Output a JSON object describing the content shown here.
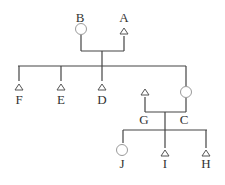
{
  "diagram": {
    "type": "pedigree",
    "legend_note": "circle = female, triangle = male",
    "colors": {
      "line": "#444444",
      "female_outline": "#9a9a9a",
      "male_outline": "#555555",
      "text": "#333333"
    },
    "individuals": [
      {
        "id": "B",
        "label": "B",
        "symbol": "circle",
        "generation": 1
      },
      {
        "id": "A",
        "label": "A",
        "symbol": "triangle",
        "generation": 1
      },
      {
        "id": "F",
        "label": "F",
        "symbol": "triangle",
        "generation": 2
      },
      {
        "id": "E",
        "label": "E",
        "symbol": "triangle",
        "generation": 2
      },
      {
        "id": "D",
        "label": "D",
        "symbol": "triangle",
        "generation": 2
      },
      {
        "id": "C",
        "label": "C",
        "symbol": "circle",
        "generation": 2
      },
      {
        "id": "G",
        "label": "G",
        "symbol": "triangle",
        "generation": 2
      },
      {
        "id": "J",
        "label": "J",
        "symbol": "circle",
        "generation": 3
      },
      {
        "id": "I",
        "label": "I",
        "symbol": "triangle",
        "generation": 3
      },
      {
        "id": "H",
        "label": "H",
        "symbol": "triangle",
        "generation": 3
      }
    ],
    "unions": [
      {
        "partners": [
          "B",
          "A"
        ],
        "children": [
          "F",
          "E",
          "D",
          "C"
        ]
      },
      {
        "partners": [
          "G",
          "C"
        ],
        "children": [
          "J",
          "I",
          "H"
        ]
      }
    ]
  }
}
